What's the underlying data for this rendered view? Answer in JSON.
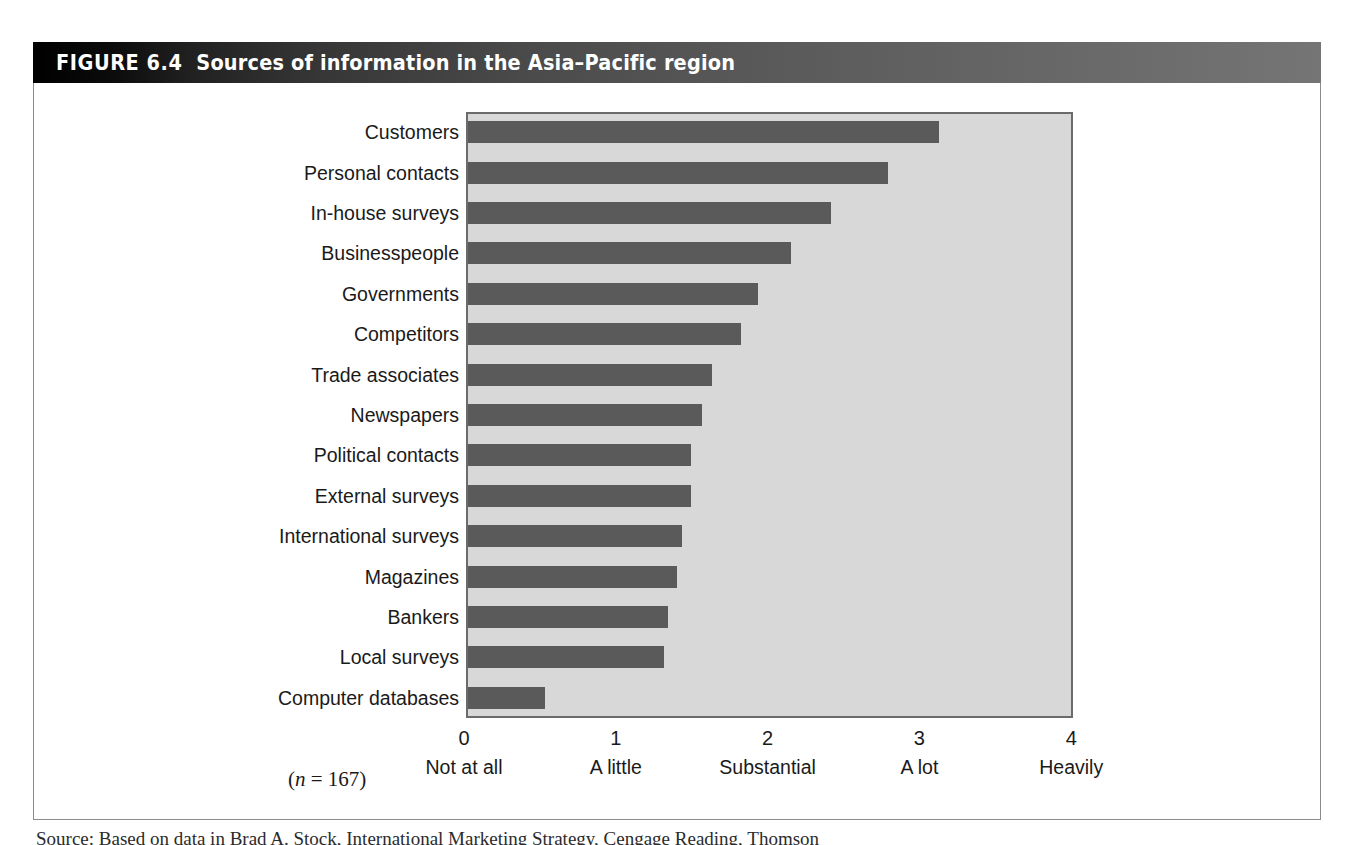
{
  "figure": {
    "number_label": "FIGURE 6.4",
    "title": "Sources of information in the Asia–Pacific region",
    "note": "(n = 167)",
    "note_italic_part": "n",
    "note_rest": " = 167)",
    "note_open": "(",
    "source_text": "Source: Based on data in Brad A. Stock, International Marketing Strategy, Cengage Reading, Thomson"
  },
  "colors": {
    "bar": "#5a5a5a",
    "plot_background": "#d8d8d8",
    "plot_border": "#6b6b6b",
    "title_band_dark": "#000000",
    "title_band_light": "#757575",
    "title_text": "#ffffff",
    "frame_border": "#8c8c8c",
    "text": "#1a1a1a"
  },
  "chart_data": {
    "type": "bar",
    "orientation": "horizontal",
    "title": "Sources of information in the Asia–Pacific region",
    "xlabel": "",
    "ylabel": "",
    "xlim": [
      0,
      4
    ],
    "grid": false,
    "legend": "none",
    "annotations": [
      "(n = 167)"
    ],
    "categories": [
      "Customers",
      "Personal contacts",
      "In-house surveys",
      "Businesspeople",
      "Governments",
      "Competitors",
      "Trade associates",
      "Newspapers",
      "Political contacts",
      "External surveys",
      "International surveys",
      "Magazines",
      "Bankers",
      "Local surveys",
      "Computer databases"
    ],
    "values": [
      3.1,
      2.77,
      2.39,
      2.13,
      1.91,
      1.8,
      1.61,
      1.54,
      1.47,
      1.47,
      1.41,
      1.38,
      1.32,
      1.29,
      0.51
    ],
    "xticks": [
      {
        "value": "0",
        "label": "Not at all"
      },
      {
        "value": "1",
        "label": "A little"
      },
      {
        "value": "2",
        "label": "Substantial"
      },
      {
        "value": "3",
        "label": "A lot"
      },
      {
        "value": "4",
        "label": "Heavily"
      }
    ]
  }
}
